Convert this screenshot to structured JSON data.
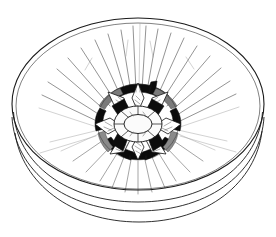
{
  "artwork": {
    "title": "Shallow bowl with central floral rosette medallion",
    "subject": "bowl",
    "style": "black-and-white ink line drawing",
    "view": "three-quarter oblique interior view",
    "background_color": "#ffffff",
    "ink_color": "#1a1a1a"
  },
  "canvas": {
    "width": 276,
    "height": 237
  },
  "bowl": {
    "name": "bowl-vessel",
    "rim": {
      "label": "bowl-rim-ellipse",
      "center_x": 138,
      "center_y": 104,
      "radius_x": 126,
      "radius_y": 86,
      "stroke_width": 1.1
    },
    "rim_inner": {
      "label": "bowl-rim-inner-ellipse",
      "center_x": 138,
      "center_y": 106,
      "radius_x": 122,
      "radius_y": 83,
      "stroke_width": 0.7
    },
    "body_mid": {
      "label": "bowl-body-mid-arc",
      "stroke_width": 0.9
    },
    "body_outer": {
      "label": "bowl-body-outer-arc",
      "stroke_width": 0.9
    },
    "base": {
      "label": "bowl-base-arc",
      "stroke_width": 0.9
    }
  },
  "rosette": {
    "name": "central-floral-rosette",
    "center_x": 138,
    "center_y": 124,
    "petal_count": 6,
    "outer_ring": {
      "label": "dark-segmented-outer-ring",
      "color": "#0b0b0b",
      "radius_x": 47,
      "radius_y": 38,
      "segments": 6
    },
    "inner_ring": {
      "label": "segmented-inner-ring",
      "radius_x": 23,
      "radius_y": 17,
      "segments": 8
    },
    "core": {
      "label": "rosette-core-ellipse",
      "radius_x": 14,
      "radius_y": 9,
      "fill": "#fbfbfb"
    },
    "stem": {
      "label": "rosette-stem-knob",
      "x": 150,
      "y": 84,
      "color": "#0d0d0d"
    }
  },
  "rays": {
    "name": "radiating-interior-lines",
    "count_upper": 21,
    "count_lower": 17,
    "color_primary": "#3a3a3a",
    "color_faint": "#9a9a9a"
  }
}
